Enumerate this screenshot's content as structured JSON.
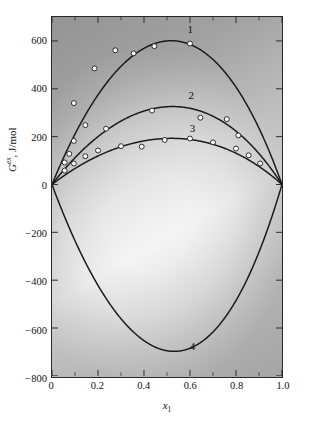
{
  "figure": {
    "background_color": "#ffffff",
    "plot_gradient_light": "#ffffff",
    "plot_gradient_dark": "#b4b4b4",
    "axis_color": "#2a2a2a",
    "curve_color": "#1a1a1a",
    "marker_fill": "#ffffff",
    "marker_edge": "#2a2a2a"
  },
  "axis_titles": {
    "y_symbol": "G",
    "y_superscript": "ex",
    "y_units": ", J/mol",
    "x_symbol": "x",
    "x_subscript": "1"
  },
  "chart_data": {
    "type": "line",
    "title": "",
    "subtitle": "",
    "xlabel": "x1",
    "ylabel": "G^ex, J/mol",
    "xlim": [
      0,
      1.0
    ],
    "ylim": [
      -800,
      700
    ],
    "grid": false,
    "legend_position": "inline-curve-labels",
    "x_ticks": [
      0,
      0.2,
      0.4,
      0.6,
      0.8,
      1.0
    ],
    "x_tick_labels": [
      "0",
      "0.2",
      "0.4",
      "0.6",
      "0.8",
      "1.0"
    ],
    "y_ticks": [
      600,
      400,
      200,
      0,
      -200,
      -400,
      -600,
      -800
    ],
    "y_tick_labels": [
      "600",
      "400",
      "200",
      "0",
      "-200",
      "-400",
      "-600",
      "-800"
    ],
    "annotations": [
      {
        "text": "1",
        "x": 0.6,
        "y": 648
      },
      {
        "text": "2",
        "x": 0.605,
        "y": 372
      },
      {
        "text": "3",
        "x": 0.61,
        "y": 236
      },
      {
        "text": "4",
        "x": 0.61,
        "y": -668
      }
    ],
    "series": [
      {
        "name": "1",
        "label": "1",
        "curve": {
          "model": "redlich-kister",
          "A": 2400,
          "B": 170,
          "C": 120,
          "peak_x": 0.47,
          "peak_y": 603
        },
        "points": [
          {
            "x": 0.055,
            "y": 92
          },
          {
            "x": 0.075,
            "y": 128
          },
          {
            "x": 0.095,
            "y": 340
          },
          {
            "x": 0.185,
            "y": 485
          },
          {
            "x": 0.275,
            "y": 561
          },
          {
            "x": 0.355,
            "y": 548
          },
          {
            "x": 0.445,
            "y": 578
          },
          {
            "x": 0.6,
            "y": 589
          }
        ]
      },
      {
        "name": "2",
        "label": "2",
        "curve": {
          "model": "redlich-kister",
          "A": 1300,
          "B": 120,
          "C": 60,
          "peak_x": 0.52,
          "peak_y": 327
        },
        "points": [
          {
            "x": 0.095,
            "y": 182
          },
          {
            "x": 0.145,
            "y": 248
          },
          {
            "x": 0.235,
            "y": 233
          },
          {
            "x": 0.435,
            "y": 309
          },
          {
            "x": 0.645,
            "y": 279
          },
          {
            "x": 0.76,
            "y": 273
          },
          {
            "x": 0.81,
            "y": 205
          }
        ]
      },
      {
        "name": "3",
        "label": "3",
        "curve": {
          "model": "redlich-kister",
          "A": 770,
          "B": 60,
          "C": 30,
          "peak_x": 0.55,
          "peak_y": 193
        },
        "points": [
          {
            "x": 0.055,
            "y": 58
          },
          {
            "x": 0.095,
            "y": 88
          },
          {
            "x": 0.145,
            "y": 118
          },
          {
            "x": 0.2,
            "y": 142
          },
          {
            "x": 0.3,
            "y": 160
          },
          {
            "x": 0.39,
            "y": 158
          },
          {
            "x": 0.49,
            "y": 186
          },
          {
            "x": 0.6,
            "y": 192
          },
          {
            "x": 0.7,
            "y": 176
          },
          {
            "x": 0.8,
            "y": 150
          },
          {
            "x": 0.855,
            "y": 122
          },
          {
            "x": 0.905,
            "y": 88
          }
        ]
      },
      {
        "name": "4",
        "label": "4",
        "curve": {
          "model": "redlich-kister",
          "A": -2780,
          "B": -330,
          "C": -150,
          "peak_x": 0.575,
          "peak_y": -700
        },
        "points": []
      }
    ]
  }
}
